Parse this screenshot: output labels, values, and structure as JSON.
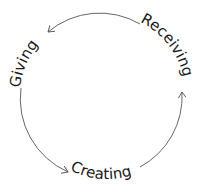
{
  "diagram": {
    "type": "cycle",
    "direction": "counter-clockwise",
    "stages": [
      {
        "label": "Receiving",
        "position": "top-right"
      },
      {
        "label": "Giving",
        "position": "top-left"
      },
      {
        "label": "Creating",
        "position": "bottom"
      }
    ],
    "edges": [
      {
        "from": "Receiving",
        "to": "Giving"
      },
      {
        "from": "Giving",
        "to": "Creating"
      },
      {
        "from": "Creating",
        "to": "Receiving"
      }
    ],
    "colors": {
      "text": "#1a1a1a",
      "line": "#555555",
      "background": "#ffffff"
    }
  }
}
